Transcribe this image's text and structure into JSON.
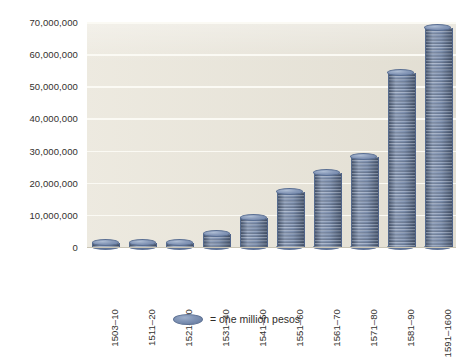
{
  "chart_data": {
    "type": "bar",
    "title": "",
    "subtitle": "",
    "xlabel": "",
    "ylabel": "",
    "categories": [
      "1503–10",
      "1511–20",
      "1521–30",
      "1531–40",
      "1541–50",
      "1551–60",
      "1561–70",
      "1571–80",
      "1581–90",
      "1591–1600"
    ],
    "values": [
      1000000,
      1000000,
      1000000,
      4000000,
      9000000,
      17000000,
      23000000,
      28000000,
      54000000,
      68000000
    ],
    "ylim": [
      0,
      70000000
    ],
    "ytick_values": [
      0,
      10000000,
      20000000,
      30000000,
      40000000,
      50000000,
      60000000,
      70000000
    ],
    "ytick_labels": [
      "0",
      "10,000,000",
      "20,000,000",
      "30,000,000",
      "40,000,000",
      "50,000,000",
      "60,000,000",
      "70,000,000"
    ],
    "grid": true,
    "grid_color": "#fbfaf4",
    "plot_background": "#e9e5d9",
    "figure_background": "#ffffff",
    "bar_style": "coin-stack",
    "bar_color": "#7186a9",
    "bar_edge_color": "#5a6f93",
    "legend": {
      "position": "bottom-center",
      "entries": [
        {
          "marker": "coin-disc",
          "label": "= one million pesos"
        }
      ]
    },
    "unit_per_coin": 1000000
  },
  "legend": {
    "coin_icon": "coin-disc-icon",
    "text": "= one million pesos"
  }
}
